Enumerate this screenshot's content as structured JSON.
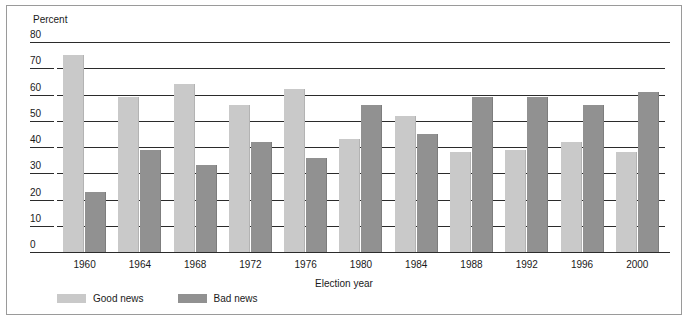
{
  "chart_data": {
    "type": "bar",
    "title": "",
    "xlabel": "Election year",
    "ylabel": "Percent",
    "ylim": [
      0,
      80
    ],
    "yticks": [
      0,
      10,
      20,
      30,
      40,
      50,
      60,
      70,
      80
    ],
    "grid": true,
    "legend_position": "bottom-left",
    "categories": [
      "1960",
      "1964",
      "1968",
      "1972",
      "1976",
      "1980",
      "1984",
      "1988",
      "1992",
      "1996",
      "2000"
    ],
    "series": [
      {
        "name": "Good news",
        "color": "#c9c9c9",
        "values": [
          75,
          59,
          64,
          56,
          62,
          43,
          52,
          38,
          39,
          42,
          38
        ]
      },
      {
        "name": "Bad news",
        "color": "#919191",
        "values": [
          23,
          39,
          33,
          42,
          36,
          56,
          45,
          59,
          59,
          56,
          61
        ]
      }
    ]
  }
}
